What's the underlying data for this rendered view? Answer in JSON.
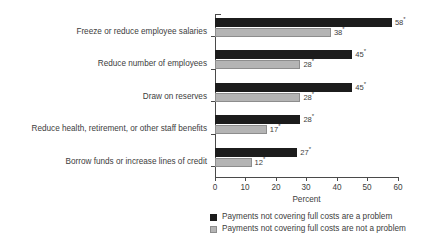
{
  "chart_data": {
    "type": "bar",
    "orientation": "horizontal",
    "title": "",
    "xlabel": "Percent",
    "ylabel": "",
    "xlim": [
      0,
      60
    ],
    "xticks": [
      "0",
      "10",
      "20",
      "30",
      "40",
      "50",
      "60"
    ],
    "grid": false,
    "legend_position": "bottom",
    "categories": [
      "Freeze or reduce employee salaries",
      "Reduce number of employees",
      "Draw on reserves",
      "Reduce health, retirement, or other staff benefits",
      "Borrow funds or increase lines of credit"
    ],
    "series": [
      {
        "name": "Payments not covering full costs are a problem",
        "color": "#1c1c1c",
        "values": [
          58,
          45,
          45,
          28,
          27
        ],
        "value_labels": [
          "58",
          "45",
          "45",
          "28",
          "27"
        ],
        "value_label_marker": "*"
      },
      {
        "name": "Payments not covering full costs are not a problem",
        "color": "#b4b4b4",
        "values": [
          38,
          28,
          28,
          17,
          12
        ],
        "value_labels": [
          "38",
          "28",
          "28",
          "17",
          "12"
        ],
        "value_label_marker": "*"
      }
    ]
  }
}
